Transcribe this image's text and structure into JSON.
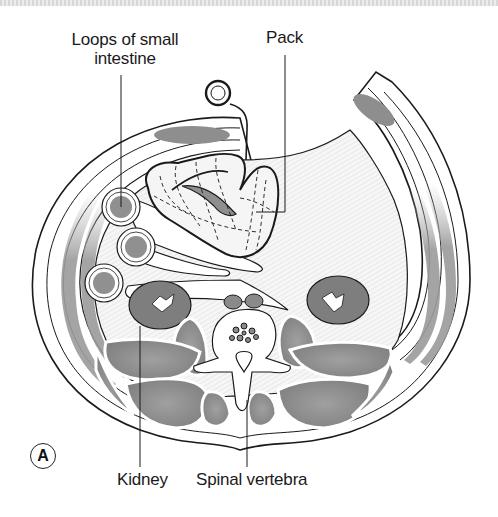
{
  "figure": {
    "panel_label": "A",
    "type": "Transverse cross-section of abdomen with surgical pack",
    "labels": {
      "loops_line1": "Loops of small",
      "loops_line2": "intestine",
      "pack": "Pack",
      "kidney": "Kidney",
      "spinal": "Spinal vertebra"
    },
    "colors": {
      "outline": "#1a1a1a",
      "muscle": "#8c8c8c",
      "muscle_light": "#a8a8a8",
      "cavity_hatch": "#ececec",
      "pack_fill": "#f4f4f4",
      "background": "#ffffff"
    }
  }
}
